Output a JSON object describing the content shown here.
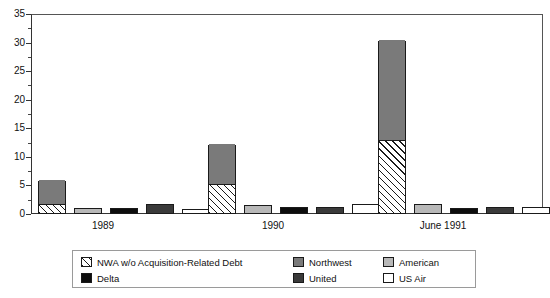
{
  "chart_data": {
    "type": "bar",
    "title": "",
    "xlabel": "",
    "ylabel": "",
    "ylim": [
      0,
      35
    ],
    "ytick_step": 5,
    "yticks": [
      "0",
      "5",
      "10",
      "15",
      "20",
      "25",
      "30",
      "35"
    ],
    "grid": false,
    "legend_position": "bottom",
    "categories": [
      "1989",
      "1990",
      "June 1991"
    ],
    "stacked_note": "Northwest bar is drawn as a stack: hatched lower portion = NWA w/o Acquisition-Related Debt, solid gray upper portion completes the Northwest total.",
    "series": [
      {
        "name": "NWA w/o Acquisition-Related Debt",
        "fill": "hatch-diagonal",
        "values": [
          1.5,
          5.0,
          12.7
        ]
      },
      {
        "name": "Northwest",
        "fill": "#7a7a7a",
        "values": [
          5.7,
          12.1,
          30.2
        ]
      },
      {
        "name": "American",
        "fill": "#b8b8b8",
        "values": [
          1.0,
          1.5,
          1.8
        ]
      },
      {
        "name": "Delta",
        "fill": "#0d0d0d",
        "values": [
          1.0,
          1.3,
          1.0
        ]
      },
      {
        "name": "United",
        "fill": "#3a3a3a",
        "values": [
          1.7,
          1.3,
          1.2
        ]
      },
      {
        "name": "US Air",
        "fill": "#ffffff",
        "values": [
          0.8,
          1.7,
          1.3
        ]
      }
    ]
  },
  "legend": {
    "items": [
      {
        "label": "NWA w/o Acquisition-Related Debt",
        "fill": "hatch-diagonal"
      },
      {
        "label": "Delta",
        "fill": "#0d0d0d"
      },
      {
        "label": "Northwest",
        "fill": "#7a7a7a"
      },
      {
        "label": "United",
        "fill": "#3a3a3a"
      },
      {
        "label": "American",
        "fill": "#b8b8b8"
      },
      {
        "label": "US Air",
        "fill": "#ffffff"
      }
    ]
  }
}
